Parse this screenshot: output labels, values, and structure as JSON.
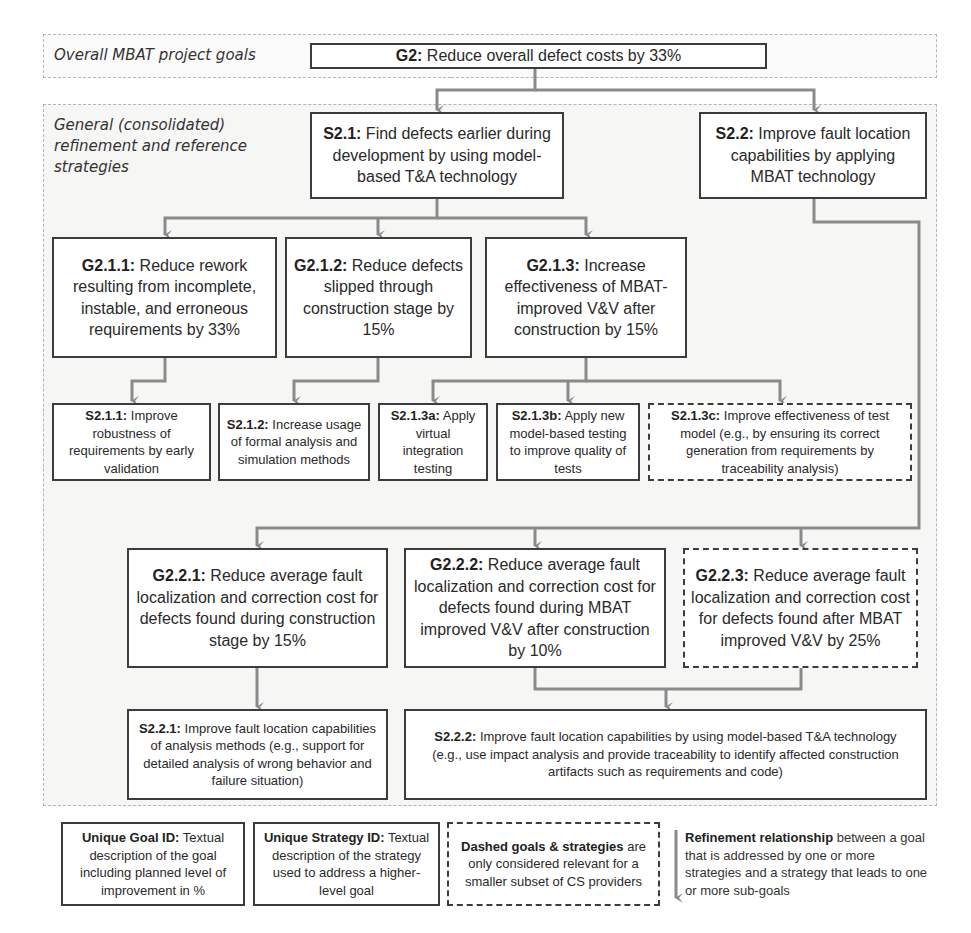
{
  "colors": {
    "box_border": "#3c3c3c",
    "connector": "#8a8a8a",
    "region_border": "#b5b5b5",
    "region_fill": "#f6f6f5"
  },
  "regions": {
    "top_label": "Overall MBAT project goals",
    "main_label_lines": [
      "General (consolidated)",
      "refinement and reference",
      "strategies"
    ]
  },
  "nodes": {
    "G2": {
      "id": "G2:",
      "text": " Reduce overall defect costs by 33%",
      "dashed": false
    },
    "S2_1": {
      "id": "S2.1:",
      "text": " Find defects earlier during development by using model-based T&A technology",
      "dashed": false
    },
    "S2_2": {
      "id": "S2.2:",
      "text": " Improve fault location capabilities by applying MBAT technology",
      "dashed": false
    },
    "G2_1_1": {
      "id": "G2.1.1:",
      "text": " Reduce rework resulting from incomplete, instable, and erroneous requirements by 33%",
      "dashed": false
    },
    "G2_1_2": {
      "id": "G2.1.2:",
      "text": " Reduce defects slipped through construction stage by 15%",
      "dashed": false
    },
    "G2_1_3": {
      "id": "G2.1.3:",
      "text": " Increase effectiveness of MBAT-improved V&V after construction by 15%",
      "dashed": false
    },
    "S2_1_1": {
      "id": "S2.1.1:",
      "text": " Improve robustness of requirements by early validation",
      "dashed": false
    },
    "S2_1_2": {
      "id": "S2.1.2:",
      "text": " Increase usage of formal analysis and simulation methods",
      "dashed": false
    },
    "S2_1_3a": {
      "id": "S2.1.3a:",
      "text": " Apply virtual integration testing",
      "dashed": false
    },
    "S2_1_3b": {
      "id": "S2.1.3b:",
      "text": " Apply new model-based testing to improve quality of tests",
      "dashed": false
    },
    "S2_1_3c": {
      "id": "S2.1.3c:",
      "text": " Improve effectiveness of test model (e.g., by ensuring its correct generation from requirements by traceability analysis)",
      "dashed": true
    },
    "G2_2_1": {
      "id": "G2.2.1:",
      "text": " Reduce average fault localization and correction cost for defects found during construction stage by 15%",
      "dashed": false
    },
    "G2_2_2": {
      "id": "G2.2.2:",
      "text": " Reduce average fault localization and correction cost for defects found during MBAT improved V&V after construction by 10%",
      "dashed": false
    },
    "G2_2_3": {
      "id": "G2.2.3:",
      "text": " Reduce average fault localization and correction cost for defects found after MBAT improved V&V by 25%",
      "dashed": true
    },
    "S2_2_1": {
      "id": "S2.2.1:",
      "text": " Improve fault location capabilities of analysis methods (e.g., support for detailed analysis of wrong behavior and failure situation)",
      "dashed": false
    },
    "S2_2_2": {
      "id": "S2.2.2:",
      "text": " Improve fault location capabilities by using model-based T&A technology (e.g., use impact analysis and provide traceability to identify affected construction artifacts such as requirements and code)",
      "dashed": false
    }
  },
  "edges": [
    [
      "G2",
      "S2_1"
    ],
    [
      "G2",
      "S2_2"
    ],
    [
      "S2_1",
      "G2_1_1"
    ],
    [
      "S2_1",
      "G2_1_2"
    ],
    [
      "S2_1",
      "G2_1_3"
    ],
    [
      "G2_1_1",
      "S2_1_1"
    ],
    [
      "G2_1_2",
      "S2_1_2"
    ],
    [
      "G2_1_3",
      "S2_1_3a"
    ],
    [
      "G2_1_3",
      "S2_1_3b"
    ],
    [
      "G2_1_3",
      "S2_1_3c"
    ],
    [
      "S2_2",
      "G2_2_1"
    ],
    [
      "S2_2",
      "G2_2_2"
    ],
    [
      "S2_2",
      "G2_2_3"
    ],
    [
      "G2_2_1",
      "S2_2_1"
    ],
    [
      "G2_2_2",
      "S2_2_2"
    ],
    [
      "G2_2_3",
      "S2_2_2"
    ]
  ],
  "legend": {
    "goal": {
      "title": "Unique Goal ID:",
      "text": " Textual description of the goal including planned level of improvement in %"
    },
    "strategy": {
      "title": "Unique Strategy ID:",
      "text": " Textual description of the strategy used to address a higher-level goal"
    },
    "dashed": {
      "title": "Dashed goals & strategies",
      "text": " are only considered relevant for a smaller subset of CS providers"
    },
    "arrow": {
      "title": "Refinement relationship",
      "text": " between a goal that is addressed by one or more strategies and a strategy that leads to one or more sub-goals"
    }
  }
}
